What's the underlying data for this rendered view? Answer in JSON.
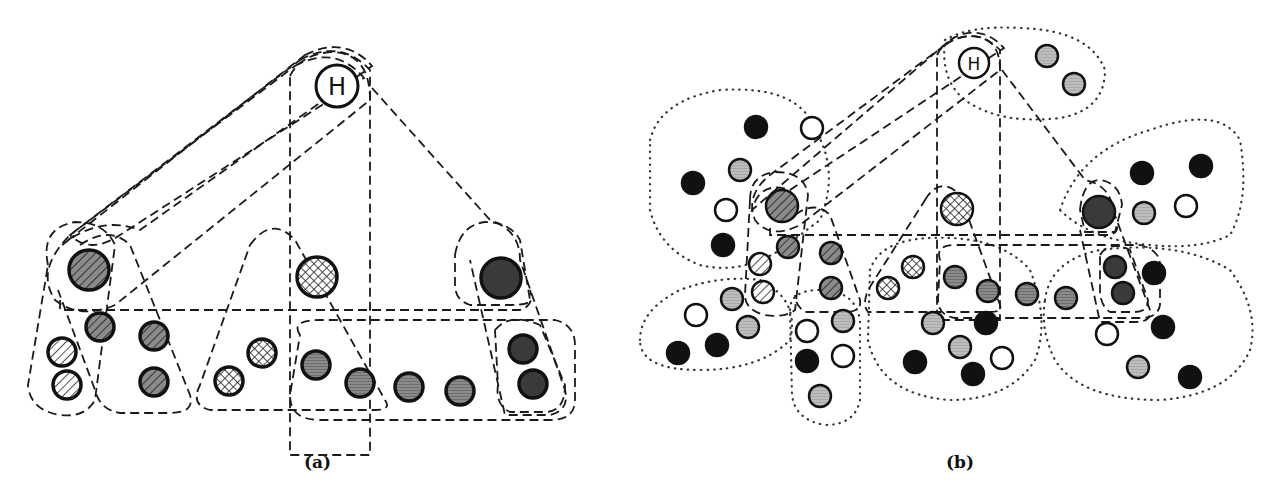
{
  "captions": {
    "a": "(a)",
    "b": "(b)"
  },
  "hub_label": "H",
  "legend_patterns": {
    "diag_dark": "dark diagonal hatch",
    "diag_light": "light diagonal hatch",
    "cross": "cross-hatch",
    "gray": "gray horizontal stripes",
    "lightgray": "light gray",
    "dark": "dark filled",
    "black": "solid black",
    "white": "empty white"
  },
  "colors": {
    "stroke": "#111111",
    "gray": "#8a8a8a",
    "lightgray": "#bdbdbd",
    "dark": "#3a3a3a",
    "black": "#111111",
    "white": "#ffffff"
  },
  "panel_a": {
    "hub": {
      "x": 337,
      "y": 86,
      "r": 21
    },
    "nodes": [
      {
        "x": 89,
        "y": 270,
        "r": 20,
        "type": "diag_dark"
      },
      {
        "x": 100,
        "y": 327,
        "r": 14,
        "type": "diag_dark"
      },
      {
        "x": 154,
        "y": 336,
        "r": 14,
        "type": "diag_dark"
      },
      {
        "x": 154,
        "y": 382,
        "r": 14,
        "type": "diag_dark"
      },
      {
        "x": 62,
        "y": 352,
        "r": 14,
        "type": "diag_light"
      },
      {
        "x": 67,
        "y": 385,
        "r": 14,
        "type": "diag_light"
      },
      {
        "x": 317,
        "y": 277,
        "r": 20,
        "type": "cross"
      },
      {
        "x": 262,
        "y": 353,
        "r": 14,
        "type": "cross"
      },
      {
        "x": 229,
        "y": 381,
        "r": 14,
        "type": "cross"
      },
      {
        "x": 316,
        "y": 365,
        "r": 14,
        "type": "gray"
      },
      {
        "x": 360,
        "y": 383,
        "r": 14,
        "type": "gray"
      },
      {
        "x": 409,
        "y": 387,
        "r": 14,
        "type": "gray"
      },
      {
        "x": 460,
        "y": 391,
        "r": 14,
        "type": "gray"
      },
      {
        "x": 501,
        "y": 278,
        "r": 20,
        "type": "dark"
      },
      {
        "x": 523,
        "y": 349,
        "r": 14,
        "type": "dark"
      },
      {
        "x": 533,
        "y": 384,
        "r": 14,
        "type": "dark"
      }
    ]
  },
  "panel_b": {
    "hub": {
      "x": 974,
      "y": 63,
      "r": 15
    },
    "nodes": [
      {
        "x": 782,
        "y": 206,
        "r": 16,
        "type": "diag_dark"
      },
      {
        "x": 788,
        "y": 247,
        "r": 11,
        "type": "diag_dark"
      },
      {
        "x": 831,
        "y": 253,
        "r": 11,
        "type": "diag_dark"
      },
      {
        "x": 831,
        "y": 288,
        "r": 11,
        "type": "diag_dark"
      },
      {
        "x": 760,
        "y": 264,
        "r": 11,
        "type": "diag_light"
      },
      {
        "x": 763,
        "y": 292,
        "r": 11,
        "type": "diag_light"
      },
      {
        "x": 957,
        "y": 209,
        "r": 16,
        "type": "cross"
      },
      {
        "x": 913,
        "y": 267,
        "r": 11,
        "type": "cross"
      },
      {
        "x": 888,
        "y": 288,
        "r": 11,
        "type": "cross"
      },
      {
        "x": 955,
        "y": 277,
        "r": 11,
        "type": "gray"
      },
      {
        "x": 988,
        "y": 291,
        "r": 11,
        "type": "gray"
      },
      {
        "x": 1027,
        "y": 294,
        "r": 11,
        "type": "gray"
      },
      {
        "x": 1066,
        "y": 298,
        "r": 11,
        "type": "gray"
      },
      {
        "x": 1099,
        "y": 212,
        "r": 16,
        "type": "dark"
      },
      {
        "x": 1115,
        "y": 267,
        "r": 11,
        "type": "dark"
      },
      {
        "x": 1123,
        "y": 293,
        "r": 11,
        "type": "dark"
      },
      {
        "x": 1047,
        "y": 56,
        "r": 11,
        "type": "lightgray"
      },
      {
        "x": 1074,
        "y": 84,
        "r": 11,
        "type": "lightgray"
      },
      {
        "x": 756,
        "y": 127,
        "r": 11,
        "type": "black"
      },
      {
        "x": 812,
        "y": 128,
        "r": 11,
        "type": "white"
      },
      {
        "x": 740,
        "y": 170,
        "r": 11,
        "type": "lightgray"
      },
      {
        "x": 693,
        "y": 183,
        "r": 11,
        "type": "black"
      },
      {
        "x": 726,
        "y": 210,
        "r": 11,
        "type": "white"
      },
      {
        "x": 723,
        "y": 245,
        "r": 11,
        "type": "black"
      },
      {
        "x": 732,
        "y": 299,
        "r": 11,
        "type": "lightgray"
      },
      {
        "x": 696,
        "y": 315,
        "r": 11,
        "type": "white"
      },
      {
        "x": 748,
        "y": 327,
        "r": 11,
        "type": "lightgray"
      },
      {
        "x": 678,
        "y": 353,
        "r": 11,
        "type": "black"
      },
      {
        "x": 717,
        "y": 345,
        "r": 11,
        "type": "black"
      },
      {
        "x": 843,
        "y": 321,
        "r": 11,
        "type": "lightgray"
      },
      {
        "x": 807,
        "y": 331,
        "r": 11,
        "type": "white"
      },
      {
        "x": 807,
        "y": 361,
        "r": 11,
        "type": "black"
      },
      {
        "x": 843,
        "y": 356,
        "r": 11,
        "type": "white"
      },
      {
        "x": 820,
        "y": 396,
        "r": 11,
        "type": "lightgray"
      },
      {
        "x": 933,
        "y": 323,
        "r": 11,
        "type": "lightgray"
      },
      {
        "x": 986,
        "y": 323,
        "r": 11,
        "type": "black"
      },
      {
        "x": 960,
        "y": 347,
        "r": 11,
        "type": "lightgray"
      },
      {
        "x": 915,
        "y": 362,
        "r": 11,
        "type": "black"
      },
      {
        "x": 1002,
        "y": 358,
        "r": 11,
        "type": "white"
      },
      {
        "x": 973,
        "y": 374,
        "r": 11,
        "type": "black"
      },
      {
        "x": 1142,
        "y": 173,
        "r": 11,
        "type": "black"
      },
      {
        "x": 1201,
        "y": 166,
        "r": 11,
        "type": "black"
      },
      {
        "x": 1144,
        "y": 213,
        "r": 11,
        "type": "lightgray"
      },
      {
        "x": 1186,
        "y": 206,
        "r": 11,
        "type": "white"
      },
      {
        "x": 1154,
        "y": 273,
        "r": 11,
        "type": "black"
      },
      {
        "x": 1107,
        "y": 334,
        "r": 11,
        "type": "white"
      },
      {
        "x": 1163,
        "y": 327,
        "r": 11,
        "type": "black"
      },
      {
        "x": 1138,
        "y": 367,
        "r": 11,
        "type": "lightgray"
      },
      {
        "x": 1190,
        "y": 377,
        "r": 11,
        "type": "black"
      }
    ]
  }
}
